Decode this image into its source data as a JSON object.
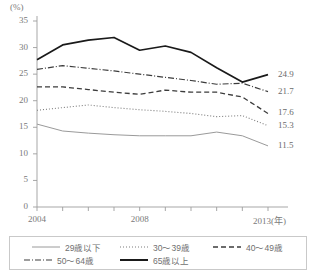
{
  "chart_data": {
    "type": "line",
    "title": "",
    "subtitle": "",
    "xlabel": "2013(年)",
    "ylabel": "(%)",
    "unit_label": "(%)",
    "xlim": [
      2004,
      2013
    ],
    "ylim": [
      0,
      35
    ],
    "ytick_values": [
      0,
      5,
      10,
      15,
      20,
      25,
      30,
      35
    ],
    "ytick_labels": [
      "0",
      "5",
      "10",
      "15",
      "20",
      "25",
      "30",
      "35"
    ],
    "x": [
      2004,
      2005,
      2006,
      2007,
      2008,
      2009,
      2010,
      2011,
      2012,
      2013
    ],
    "xtick_labels": [
      "2004",
      "",
      "",
      "",
      "2008",
      "",
      "",
      "",
      "",
      "2013(年)"
    ],
    "xtick_shown": [
      {
        "value": 2004,
        "label": "2004"
      },
      {
        "value": 2008,
        "label": "2008"
      },
      {
        "value": 2013,
        "label": "2013(年)"
      }
    ],
    "grid": false,
    "legend_position": "bottom",
    "series": [
      {
        "name": "29歳以下",
        "style": "solid-thin",
        "color": "#9a9a9a",
        "values": [
          15.6,
          14.3,
          13.9,
          13.6,
          13.4,
          13.4,
          13.4,
          14.1,
          13.4,
          11.5
        ],
        "end_label": "11.5"
      },
      {
        "name": "30～39歳",
        "style": "dotted",
        "color": "#7d7d7d",
        "values": [
          18.2,
          18.7,
          19.2,
          18.7,
          18.3,
          18.0,
          17.6,
          17.0,
          17.2,
          15.3
        ],
        "end_label": "15.3"
      },
      {
        "name": "40～49歳",
        "style": "dashed",
        "color": "#3c3c3c",
        "values": [
          22.6,
          22.6,
          22.1,
          21.6,
          21.2,
          22.0,
          21.6,
          21.6,
          20.7,
          17.6
        ],
        "end_label": "17.6"
      },
      {
        "name": "50～64歳",
        "style": "dash-dot",
        "color": "#3c3c3c",
        "values": [
          25.9,
          26.6,
          26.1,
          25.6,
          25.0,
          24.4,
          23.8,
          23.1,
          23.3,
          21.7
        ],
        "end_label": "21.7"
      },
      {
        "name": "65歳以上",
        "style": "solid-thick",
        "color": "#1a1a1a",
        "values": [
          27.7,
          30.5,
          31.4,
          31.9,
          29.5,
          30.3,
          29.1,
          26.2,
          23.5,
          24.9
        ],
        "end_label": "24.9"
      }
    ],
    "end_labels": [
      {
        "series": "65歳以上",
        "value": "24.9"
      },
      {
        "series": "50～64歳",
        "value": "21.7"
      },
      {
        "series": "40～49歳",
        "value": "17.6"
      },
      {
        "series": "30～39歳",
        "value": "15.3"
      },
      {
        "series": "29歳以下",
        "value": "11.5"
      }
    ]
  },
  "legend": {
    "items": [
      {
        "label": "29歳以下",
        "style": "solid-thin"
      },
      {
        "label": "30～39歳",
        "style": "dotted"
      },
      {
        "label": "40～49歳",
        "style": "dashed"
      },
      {
        "label": "50～64歳",
        "style": "dash-dot"
      },
      {
        "label": "65歳以上",
        "style": "solid-thick"
      }
    ]
  }
}
